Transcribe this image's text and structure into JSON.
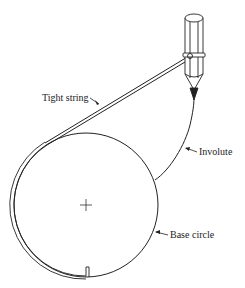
{
  "diagram": {
    "type": "involute-construction",
    "labels": {
      "tight_string": "Tight string",
      "involute": "Involute",
      "base_circle": "Base circle"
    },
    "colors": {
      "stroke": "#222222",
      "background": "#ffffff"
    }
  }
}
